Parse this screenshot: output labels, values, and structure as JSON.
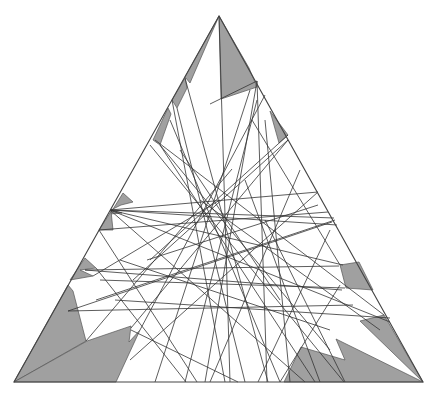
{
  "diagram": {
    "colors": {
      "background": "#ffffff",
      "shade": "#a0a0a0",
      "line": "#333333",
      "outline": "#444444"
    },
    "triangle": {
      "top": [
        219,
        16
      ],
      "bottom_left": [
        14,
        382
      ],
      "bottom_right": [
        423,
        382
      ]
    },
    "shaded_regions": [
      [
        [
          219,
          16
        ],
        [
          221,
          99
        ],
        [
          257,
          87
        ],
        [
          249,
          68
        ]
      ],
      [
        [
          219,
          16
        ],
        [
          185,
          77
        ],
        [
          190,
          83
        ]
      ],
      [
        [
          185,
          78
        ],
        [
          172,
          100
        ],
        [
          177,
          108
        ],
        [
          187,
          88
        ]
      ],
      [
        [
          168,
          108
        ],
        [
          153,
          140
        ],
        [
          160,
          145
        ],
        [
          171,
          114
        ]
      ],
      [
        [
          123,
          193
        ],
        [
          110,
          214
        ],
        [
          122,
          213
        ],
        [
          111,
          210
        ],
        [
          121,
          205
        ],
        [
          133,
          202
        ]
      ],
      [
        [
          110,
          213
        ],
        [
          99,
          230
        ],
        [
          113,
          230
        ],
        [
          111,
          211
        ]
      ],
      [
        [
          85,
          258
        ],
        [
          70,
          280
        ],
        [
          93,
          276
        ],
        [
          80,
          270
        ],
        [
          96,
          268
        ]
      ],
      [
        [
          68,
          285
        ],
        [
          14,
          382
        ],
        [
          86,
          341
        ],
        [
          73,
          291
        ]
      ],
      [
        [
          14,
          382
        ],
        [
          116,
          382
        ],
        [
          140,
          330
        ],
        [
          129,
          342
        ],
        [
          131,
          326
        ],
        [
          87,
          341
        ]
      ],
      [
        [
          270,
          111
        ],
        [
          279,
          143
        ],
        [
          288,
          135
        ]
      ],
      [
        [
          340,
          265
        ],
        [
          346,
          288
        ],
        [
          373,
          290
        ],
        [
          359,
          262
        ]
      ],
      [
        [
          384,
          315
        ],
        [
          360,
          321
        ],
        [
          423,
          382
        ]
      ],
      [
        [
          423,
          382
        ],
        [
          336,
          339
        ],
        [
          345,
          360
        ],
        [
          301,
          347
        ],
        [
          284,
          382
        ]
      ]
    ],
    "chords": [
      [
        [
          219,
          16
        ],
        [
          230,
          382
        ]
      ],
      [
        [
          257,
          81
        ],
        [
          210,
          104
        ]
      ],
      [
        [
          257,
          81
        ],
        [
          205,
          382
        ]
      ],
      [
        [
          257,
          81
        ],
        [
          267,
          382
        ]
      ],
      [
        [
          185,
          78
        ],
        [
          268,
          382
        ]
      ],
      [
        [
          172,
          100
        ],
        [
          225,
          382
        ]
      ],
      [
        [
          177,
          108
        ],
        [
          245,
          382
        ]
      ],
      [
        [
          160,
          145
        ],
        [
          315,
          382
        ]
      ],
      [
        [
          150,
          145
        ],
        [
          344,
          382
        ]
      ],
      [
        [
          252,
          120
        ],
        [
          340,
          265
        ]
      ],
      [
        [
          288,
          135
        ],
        [
          150,
          260
        ]
      ],
      [
        [
          288,
          140
        ],
        [
          133,
          280
        ]
      ],
      [
        [
          110,
          210
        ],
        [
          318,
          192
        ]
      ],
      [
        [
          110,
          210
        ],
        [
          334,
          218
        ]
      ],
      [
        [
          110,
          210
        ],
        [
          337,
          225
        ]
      ],
      [
        [
          110,
          210
        ],
        [
          305,
          382
        ]
      ],
      [
        [
          110,
          210
        ],
        [
          390,
          322
        ]
      ],
      [
        [
          110,
          210
        ],
        [
          343,
          265
        ]
      ],
      [
        [
          99,
          230
        ],
        [
          328,
          212
        ]
      ],
      [
        [
          99,
          230
        ],
        [
          197,
          382
        ]
      ],
      [
        [
          85,
          270
        ],
        [
          339,
          266
        ]
      ],
      [
        [
          85,
          270
        ],
        [
          342,
          290
        ]
      ],
      [
        [
          96,
          268
        ],
        [
          186,
          382
        ]
      ],
      [
        [
          68,
          311
        ],
        [
          332,
          222
        ]
      ],
      [
        [
          68,
          311
        ],
        [
          353,
          305
        ]
      ],
      [
        [
          86,
          341
        ],
        [
          232,
          169
        ]
      ],
      [
        [
          93,
          276
        ],
        [
          220,
          200
        ]
      ],
      [
        [
          131,
          328
        ],
        [
          288,
          140
        ]
      ],
      [
        [
          131,
          330
        ],
        [
          238,
          382
        ]
      ],
      [
        [
          140,
          330
        ],
        [
          265,
          95
        ]
      ],
      [
        [
          96,
          300
        ],
        [
          335,
          220
        ]
      ],
      [
        [
          130,
          360
        ],
        [
          318,
          192
        ]
      ],
      [
        [
          160,
          145
        ],
        [
          330,
          350
        ]
      ],
      [
        [
          155,
          140
        ],
        [
          384,
          315
        ]
      ],
      [
        [
          250,
          90
        ],
        [
          155,
          382
        ]
      ],
      [
        [
          257,
          100
        ],
        [
          185,
          382
        ]
      ],
      [
        [
          265,
          120
        ],
        [
          290,
          382
        ]
      ],
      [
        [
          170,
          120
        ],
        [
          280,
          382
        ]
      ],
      [
        [
          115,
          300
        ],
        [
          390,
          318
        ]
      ],
      [
        [
          100,
          280
        ],
        [
          345,
          288
        ]
      ],
      [
        [
          245,
          180
        ],
        [
          320,
          382
        ]
      ],
      [
        [
          265,
          220
        ],
        [
          345,
          382
        ]
      ],
      [
        [
          200,
          200
        ],
        [
          380,
          330
        ]
      ],
      [
        [
          180,
          150
        ],
        [
          280,
          300
        ]
      ],
      [
        [
          300,
          170
        ],
        [
          210,
          382
        ]
      ],
      [
        [
          330,
          230
        ],
        [
          258,
          382
        ]
      ],
      [
        [
          147,
          260
        ],
        [
          318,
          205
        ]
      ],
      [
        [
          120,
          260
        ],
        [
          330,
          330
        ]
      ],
      [
        [
          340,
          285
        ],
        [
          280,
          382
        ]
      ]
    ]
  }
}
